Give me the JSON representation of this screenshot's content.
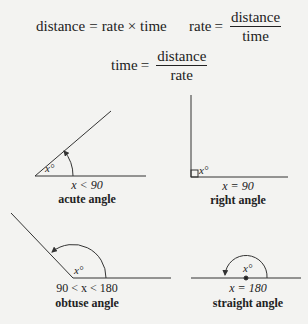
{
  "formulas": {
    "distance": {
      "lhs": "distance",
      "op": "=",
      "rhs": "rate × time"
    },
    "rate": {
      "lhs": "rate",
      "op": "=",
      "numerator": "distance",
      "denominator": "time"
    },
    "time": {
      "lhs": "time",
      "op": "=",
      "numerator": "distance",
      "denominator": "rate"
    }
  },
  "angles": {
    "acute": {
      "variable": "x°",
      "condition": "x < 90",
      "name": "acute angle"
    },
    "right": {
      "variable": "x°",
      "condition": "x = 90",
      "name": "right angle"
    },
    "obtuse": {
      "variable": "x°",
      "condition": "90 < x < 180",
      "name": "obtuse angle"
    },
    "straight": {
      "variable": "x°",
      "condition": "x = 180",
      "name": "straight angle"
    }
  },
  "colors": {
    "line": "#333333",
    "background": "#f3f3f1"
  }
}
